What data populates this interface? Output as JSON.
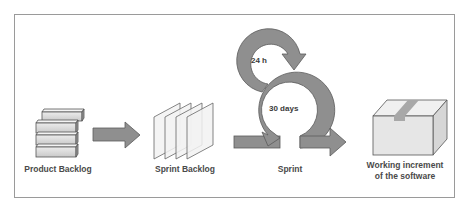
{
  "diagram": {
    "stages": [
      {
        "id": "product-backlog",
        "label": "Product Backlog",
        "icon": "stacked-bars-icon"
      },
      {
        "id": "sprint-backlog",
        "label": "Sprint Backlog",
        "icon": "stacked-sheets-icon"
      },
      {
        "id": "sprint",
        "label": "Sprint",
        "icon": "cycle-arrows-icon",
        "inner_loops": [
          {
            "label": "24 h"
          },
          {
            "label": "30 days"
          }
        ]
      },
      {
        "id": "increment",
        "label_line1": "Working increment",
        "label_line2": "of the software",
        "icon": "box-icon"
      }
    ],
    "connectors": [
      {
        "from": "product-backlog",
        "to": "sprint-backlog",
        "icon": "right-arrow-icon"
      },
      {
        "from": "sprint",
        "to": "increment",
        "icon": "right-arrow-icon"
      }
    ],
    "colors": {
      "arrow_fill": "#8f8f8f",
      "arrow_stroke": "#5a5a5a",
      "bar_fill": "#d8d8d8",
      "sheet_fill": "#f2f2f2",
      "box_front": "#e6e6e6",
      "box_top": "#f0f0f0",
      "box_side": "#dcdcdc",
      "tape": "#a8a8a8",
      "frame": "#9a9a9a",
      "text": "#4a4a4a"
    }
  }
}
